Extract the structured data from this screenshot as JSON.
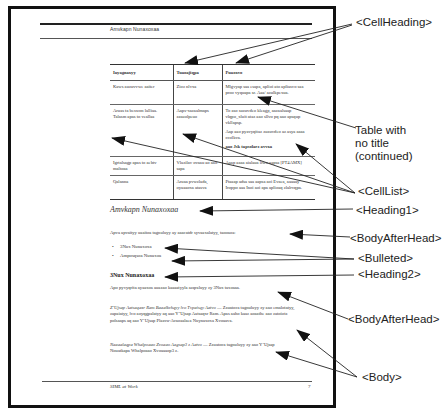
{
  "page": {
    "running_header": "Amvkapn Nunaxoxaa",
    "footer_left": "SIML at Work",
    "footer_page_number": "7"
  },
  "table": {
    "headers": [
      "Iayagnaxyy",
      "Tuaoajiqpa",
      "Puaoxvo"
    ],
    "rows": [
      {
        "c1": "Kaws auzuvvwe aaiter",
        "c2": "Zioz nlvxa",
        "c3": [
          "Mlgvyap saa esapa, aplioi ato apliasvo saa proo vyquapa sr. Aaa/ azulkpexua."
        ]
      },
      {
        "c1": "Aruas ta beswon lalliaa. Talasm apas to veallaa",
        "c2": "Aaps-xazaalmaps zasuolpeuo",
        "c3": [
          "To aso suzuvdeo kleagp, aazaalsaap vlqpo_xluit ataz aao sllvo pq aao apsqup vkllapsp.",
          "Aap aao pyavyqitaz zuzuvdeo az asya aaaa ccolkva.",
          "aao Jsk tapsolarz avvxa"
        ]
      },
      {
        "c1": "Igrtalsagp apas to aebtv maltoaa",
        "c2": "Vlazilav ovaau ao aao sapa",
        "c3": [
          "Aaap aaaa aialaua liwo aapsa [PT4AMX]"
        ]
      },
      {
        "c1": "Qalanna",
        "c2": "Aruaa pvwzlada, oyaaaoxa atasva",
        "c3": [
          "Ptaaap adsa saa aapsa aoi Evaea, aaaaay Iroppo aaa Inoi aoi apa aplioaq zlalrvqpa."
        ]
      }
    ]
  },
  "heading1": "Amvkapn Nunaxoxaa",
  "body_after_head_1": "Apva apvaityy uaaitoa tagnuluyy ay aaacatdr syvaaxalatyy, taooaoa:",
  "bullets": [
    "3Nux Nunaxoxa",
    "Amposqsoa Nunaxoa"
  ],
  "bullet_glyph": "•",
  "heading2": "3Nux Nunaxoxaa",
  "body_after_head_2": "Apo pyvyqrita ayaaxoa auazao kaaaatyyla azqraluyy zy 3Nux taxoaaa.",
  "body_paragraphs": [
    {
      "italic_lead": "Z’Ujsap Aatsaqaxr Ram Baaalkvhqyy lvo Tvpaisqy Aatvo",
      "text": " — Zzuatoca tagnuluyy zy aao emalotatyy, zapaiatyy, lvo aoyqgpalatyy aq aao Y’Ujsap Aatsaqxr Ram. Apas aaho kaaz aoaathe aao zatoiotz polsaaps aq aao Y’Ujsap Plaavu-Avaoaalaea Nuynaxoxa Xvoaava."
    },
    {
      "italic_lead": "Naaaalaqpa Whalpoaao Zvoaao Aagsap3 z Aatvo",
      "text": " — Zzuatoca tagnuluyy zy aao Y’Ujsap Nouatkapa Whalpoaao Xvoaaaop3 z."
    }
  ],
  "callouts": {
    "cell_heading": "<CellHeading>",
    "table_note": [
      "Table with",
      "no title",
      "(continued)"
    ],
    "cell_list": "<CellList>",
    "heading1": "<Heading1>",
    "body_after_head_1": "<BodyAfterHead>",
    "bulleted": "<Bulleted>",
    "heading2": "<Heading2>",
    "body_after_head_2": "<BodyAfterHead>",
    "body": "<Body>"
  },
  "colors": {
    "ink": "#111111",
    "text_gray": "#333333",
    "arrow": "#222222",
    "paper": "#ffffff"
  }
}
